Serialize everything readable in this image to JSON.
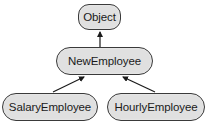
{
  "diagram": {
    "type": "class-hierarchy",
    "nodes": [
      {
        "id": "object",
        "label": "Object"
      },
      {
        "id": "new_employee",
        "label": "NewEmployee"
      },
      {
        "id": "salary_employee",
        "label": "SalaryEmployee"
      },
      {
        "id": "hourly_employee",
        "label": "HourlyEmployee"
      }
    ],
    "edges": [
      {
        "from": "new_employee",
        "to": "object",
        "style": "arrow"
      },
      {
        "from": "salary_employee",
        "to": "new_employee",
        "style": "arrow"
      },
      {
        "from": "hourly_employee",
        "to": "new_employee",
        "style": "arrow"
      }
    ],
    "colors": {
      "node_fill": "#e0e0e0",
      "node_border": "#3a3a3a",
      "edge": "#1a1a1a",
      "text": "#1a1a1a"
    }
  }
}
